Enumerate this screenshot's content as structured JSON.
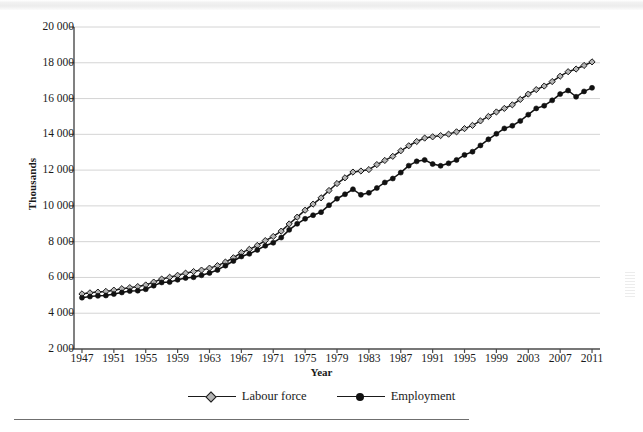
{
  "chart_data": {
    "type": "line",
    "title": "",
    "xlabel": "Year",
    "ylabel": "Thousands",
    "xlim": [
      1946,
      2012
    ],
    "ylim": [
      2000,
      20000
    ],
    "ytick_step": 2000,
    "xtick_step": 4,
    "grid": "horizontal",
    "legend_position": "bottom-center",
    "y_ticks": [
      "2 000",
      "4 000",
      "6 000",
      "8 000",
      "10 000",
      "12 000",
      "14 000",
      "16 000",
      "18 000",
      "20 000"
    ],
    "y_tick_values": [
      2000,
      4000,
      6000,
      8000,
      10000,
      12000,
      14000,
      16000,
      18000,
      20000
    ],
    "x_ticks": [
      "1947",
      "1951",
      "1955",
      "1959",
      "1963",
      "1967",
      "1971",
      "1975",
      "1979",
      "1983",
      "1987",
      "1991",
      "1995",
      "1999",
      "2003",
      "2007",
      "2011"
    ],
    "x": [
      1947,
      1948,
      1949,
      1950,
      1951,
      1952,
      1953,
      1954,
      1955,
      1956,
      1957,
      1958,
      1959,
      1960,
      1961,
      1962,
      1963,
      1964,
      1965,
      1966,
      1967,
      1968,
      1969,
      1970,
      1971,
      1972,
      1973,
      1974,
      1975,
      1976,
      1977,
      1978,
      1979,
      1980,
      1981,
      1982,
      1983,
      1984,
      1985,
      1986,
      1987,
      1988,
      1989,
      1990,
      1991,
      1992,
      1993,
      1994,
      1995,
      1996,
      1997,
      1998,
      1999,
      2000,
      2001,
      2002,
      2003,
      2004,
      2005,
      2006,
      2007,
      2008,
      2009,
      2010,
      2011
    ],
    "series": [
      {
        "name": "Labour force",
        "marker": "open-diamond",
        "color": "#1a1a1a",
        "marker_fill": "#b4b4b4",
        "values": [
          5080,
          5140,
          5180,
          5220,
          5290,
          5370,
          5430,
          5490,
          5580,
          5740,
          5910,
          6010,
          6120,
          6240,
          6330,
          6410,
          6520,
          6660,
          6860,
          7100,
          7390,
          7570,
          7790,
          8060,
          8290,
          8590,
          8990,
          9370,
          9760,
          10100,
          10450,
          10860,
          11250,
          11570,
          11890,
          11950,
          12030,
          12310,
          12540,
          12770,
          13080,
          13360,
          13600,
          13790,
          13860,
          13930,
          14010,
          14140,
          14320,
          14500,
          14750,
          15000,
          15250,
          15450,
          15650,
          15950,
          16250,
          16500,
          16700,
          16950,
          17250,
          17500,
          17650,
          17850,
          18050
        ]
      },
      {
        "name": "Employment",
        "marker": "filled-circle",
        "color": "#111111",
        "marker_fill": "#111111",
        "values": [
          4870,
          4930,
          4970,
          4990,
          5070,
          5160,
          5240,
          5260,
          5340,
          5540,
          5720,
          5740,
          5870,
          5970,
          6010,
          6120,
          6250,
          6420,
          6660,
          6920,
          7170,
          7320,
          7540,
          7770,
          7940,
          8230,
          8660,
          9000,
          9280,
          9480,
          9650,
          10040,
          10400,
          10650,
          10930,
          10620,
          10730,
          11000,
          11310,
          11530,
          11860,
          12250,
          12490,
          12570,
          12340,
          12240,
          12380,
          12570,
          12850,
          13030,
          13380,
          13720,
          14030,
          14330,
          14480,
          14750,
          15100,
          15450,
          15600,
          15900,
          16250,
          16450,
          16100,
          16400,
          16600
        ]
      }
    ],
    "note_labour_end": 18900,
    "note_employment_end": 17500
  },
  "legend": {
    "items": [
      {
        "label": "Labour force",
        "marker": "open-diamond"
      },
      {
        "label": "Employment",
        "marker": "filled-circle"
      }
    ]
  },
  "axis_titles": {
    "x": "Year",
    "y": "Thousands"
  },
  "colors": {
    "axis": "#4a4a4a",
    "grid": "#d4d4d4",
    "text": "#1a1a1a",
    "labour_marker_fill": "#b4b4b4",
    "employment_marker_fill": "#111111",
    "line": "#1a1a1a"
  }
}
